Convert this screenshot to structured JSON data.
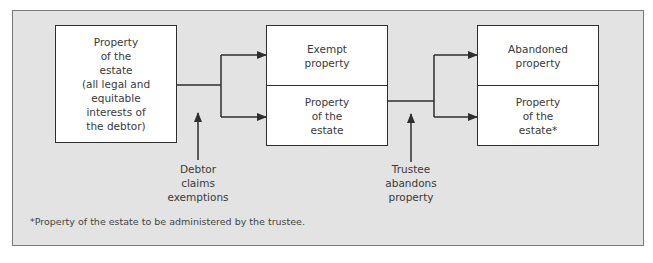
{
  "diagram": {
    "nodes": [
      {
        "id": "estate",
        "label": "Property\nof the\nestate\n(all legal and\nequitable\ninterests of\nthe debtor)"
      },
      {
        "id": "exempt",
        "label": "Exempt\nproperty"
      },
      {
        "id": "estate2",
        "label": "Property\nof the\nestate"
      },
      {
        "id": "abandoned",
        "label": "Abandoned\nproperty"
      },
      {
        "id": "estate3",
        "label": "Property\nof the\nestate*"
      }
    ],
    "actions": [
      {
        "id": "debtor",
        "label": "Debtor\nclaims\nexemptions"
      },
      {
        "id": "trustee",
        "label": "Trustee\nabandons\nproperty"
      }
    ],
    "edges": [
      {
        "from": "estate",
        "to": "exempt"
      },
      {
        "from": "estate",
        "to": "estate2"
      },
      {
        "from": "estate2",
        "to": "abandoned"
      },
      {
        "from": "estate2",
        "to": "estate3"
      }
    ],
    "footnote": "*Property of the estate to be administered by the trustee."
  },
  "colors": {
    "panel_bg": "#e2e3e2",
    "box_bg": "#ffffff",
    "line": "#2e2e2e"
  }
}
